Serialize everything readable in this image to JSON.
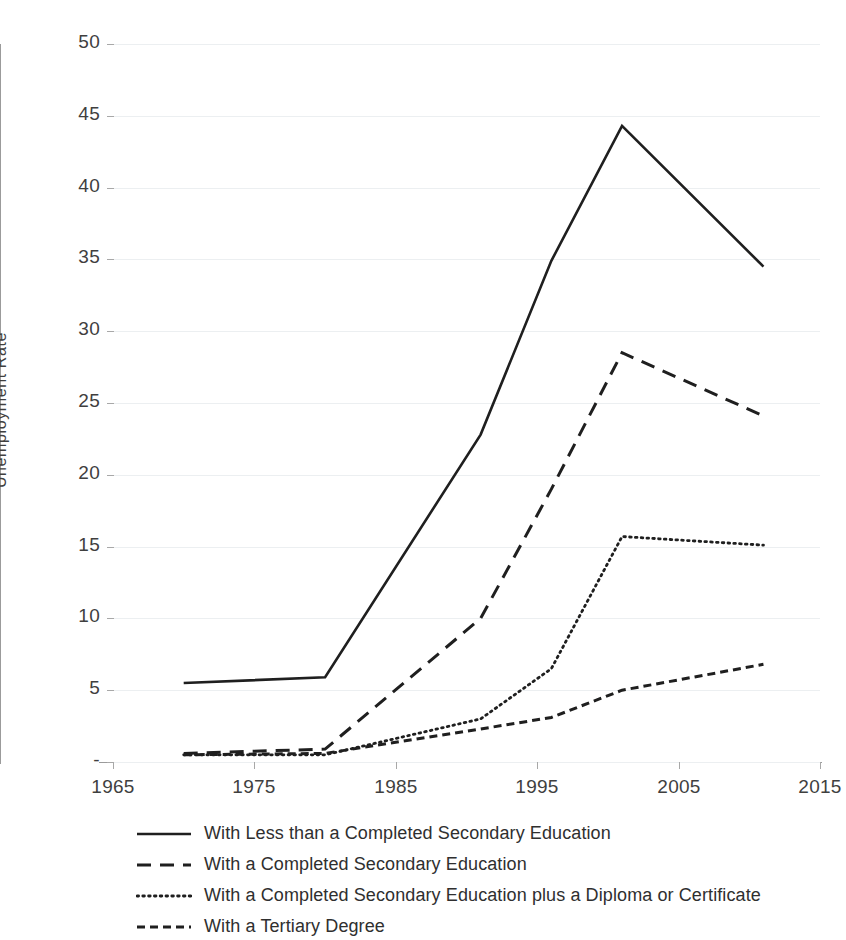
{
  "chart_data": {
    "type": "line",
    "title": "",
    "xlabel": "",
    "ylabel": "Unemployment Rate",
    "xlim": [
      1965,
      2015
    ],
    "ylim": [
      0,
      50
    ],
    "grid": true,
    "legend_position": "bottom-left",
    "x_ticks": [
      "1965",
      "1975",
      "1985",
      "1995",
      "2005",
      "2015"
    ],
    "x_tick_values": [
      1965,
      1975,
      1985,
      1995,
      2005,
      2015
    ],
    "y_ticks": [
      "-",
      "5",
      "10",
      "15",
      "20",
      "25",
      "30",
      "35",
      "40",
      "45",
      "50"
    ],
    "y_tick_values": [
      0,
      5,
      10,
      15,
      20,
      25,
      30,
      35,
      40,
      45,
      50
    ],
    "series": [
      {
        "name": "With Less than a Completed Secondary Education",
        "style": "solid",
        "x": [
          1970,
          1980,
          1991,
          1996,
          2001,
          2011
        ],
        "values": [
          5.5,
          5.9,
          22.8,
          34.9,
          44.3,
          34.5
        ]
      },
      {
        "name": "With a Completed Secondary Education",
        "style": "dashed",
        "x": [
          1970,
          1980,
          1991,
          1996,
          2001,
          2011
        ],
        "values": [
          0.6,
          0.9,
          10.0,
          19.0,
          28.5,
          24.1
        ]
      },
      {
        "name": "With a Completed Secondary Education plus a Diploma or Certificate",
        "style": "dotted",
        "x": [
          1970,
          1980,
          1991,
          1996,
          2001,
          2011
        ],
        "values": [
          0.5,
          0.5,
          3.0,
          6.5,
          15.7,
          15.1
        ]
      },
      {
        "name": "With a Tertiary Degree",
        "style": "short-dashed",
        "x": [
          1970,
          1980,
          1991,
          1996,
          2001,
          2011
        ],
        "values": [
          0.5,
          0.6,
          2.3,
          3.1,
          5.0,
          6.8
        ]
      }
    ]
  },
  "axes": {
    "y_axis_label": "Unemployment Rate"
  },
  "legend": {
    "items": [
      {
        "label": "With Less than a Completed Secondary Education",
        "style": "solid"
      },
      {
        "label": "With a Completed Secondary Education",
        "style": "dashed"
      },
      {
        "label": "With a Completed Secondary Education plus a Diploma or Certificate",
        "style": "dotted"
      },
      {
        "label": "With a Tertiary Degree",
        "style": "short-dashed"
      }
    ]
  },
  "colors": {
    "line": "#1f1f1f",
    "grid": "#eceff1",
    "axis": "#9b9b9b",
    "text": "#3f3f3f",
    "background": "#ffffff"
  }
}
